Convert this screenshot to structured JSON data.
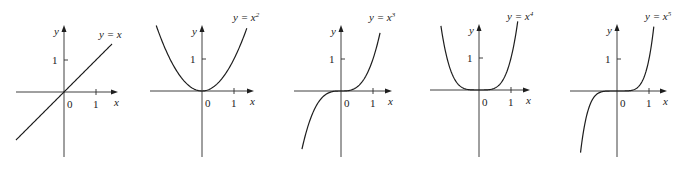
{
  "chart_data": [
    {
      "type": "line",
      "title": "y = x",
      "label_base": "y = x",
      "exponent": "",
      "power": 1,
      "xlabel": "x",
      "ylabel": "y",
      "origin_label": "0",
      "x_tick_labels": [
        "1"
      ],
      "y_tick_labels": [
        "1"
      ],
      "xlim": [
        -1.5,
        1.6
      ],
      "ylim": [
        -2.0,
        2.1
      ],
      "x": [
        -1.5,
        -1,
        -0.5,
        0,
        0.5,
        1,
        1.5
      ],
      "y": [
        -1.5,
        -1,
        -0.5,
        0,
        0.5,
        1,
        1.5
      ],
      "grid": false
    },
    {
      "type": "line",
      "title": "y = x^2",
      "label_base": "y = x",
      "exponent": "2",
      "power": 2,
      "xlabel": "x",
      "ylabel": "y",
      "origin_label": "0",
      "x_tick_labels": [
        "1"
      ],
      "y_tick_labels": [
        "1"
      ],
      "xlim": [
        -1.5,
        1.6
      ],
      "ylim": [
        -2.0,
        2.1
      ],
      "x": [
        -1.4,
        -1,
        -0.5,
        0,
        0.5,
        1,
        1.4
      ],
      "y": [
        1.96,
        1,
        0.25,
        0,
        0.25,
        1,
        1.96
      ],
      "grid": false
    },
    {
      "type": "line",
      "title": "y = x^3",
      "label_base": "y = x",
      "exponent": "3",
      "power": 3,
      "xlabel": "x",
      "ylabel": "y",
      "origin_label": "0",
      "x_tick_labels": [
        "1"
      ],
      "y_tick_labels": [
        "1"
      ],
      "xlim": [
        -1.5,
        1.6
      ],
      "ylim": [
        -2.0,
        2.1
      ],
      "x": [
        -1.22,
        -1,
        -0.5,
        0,
        0.5,
        1,
        1.22
      ],
      "y": [
        -1.82,
        -1,
        -0.125,
        0,
        0.125,
        1,
        1.82
      ],
      "grid": false
    },
    {
      "type": "line",
      "title": "y = x^4",
      "label_base": "y = x",
      "exponent": "4",
      "power": 4,
      "xlabel": "x",
      "ylabel": "y",
      "origin_label": "0",
      "x_tick_labels": [
        "1"
      ],
      "y_tick_labels": [
        "1"
      ],
      "xlim": [
        -1.5,
        1.6
      ],
      "ylim": [
        -2.0,
        2.1
      ],
      "x": [
        -1.2,
        -1,
        -0.5,
        0,
        0.5,
        1,
        1.2
      ],
      "y": [
        2.07,
        1,
        0.0625,
        0,
        0.0625,
        1,
        2.07
      ],
      "grid": false
    },
    {
      "type": "line",
      "title": "y = x^5",
      "label_base": "y = x",
      "exponent": "5",
      "power": 5,
      "xlabel": "x",
      "ylabel": "y",
      "origin_label": "0",
      "x_tick_labels": [
        "1"
      ],
      "y_tick_labels": [
        "1"
      ],
      "xlim": [
        -1.5,
        1.6
      ],
      "ylim": [
        -2.0,
        2.1
      ],
      "x": [
        -1.14,
        -1,
        -0.5,
        0,
        0.5,
        1,
        1.14
      ],
      "y": [
        -1.93,
        -1,
        -0.03,
        0,
        0.03,
        1,
        1.93
      ],
      "grid": false
    }
  ],
  "layout": {
    "panels": [
      {
        "ox": 64,
        "oy": 92,
        "xmin": -1.5,
        "xmax": 1.5,
        "axis_left": 16,
        "axis_right": 118,
        "axis_top": 25,
        "axis_bottom": 157,
        "label_x": 99,
        "label_y": 38
      },
      {
        "ox": 202,
        "oy": 91,
        "xmin": -1.43,
        "xmax": 1.4,
        "axis_left": 150,
        "axis_right": 254,
        "axis_top": 25,
        "axis_bottom": 157,
        "label_x": 233,
        "label_y": 21
      },
      {
        "ox": 341,
        "oy": 91,
        "xmin": -1.22,
        "xmax": 1.22,
        "axis_left": 294,
        "axis_right": 392,
        "axis_top": 25,
        "axis_bottom": 157,
        "label_x": 369,
        "label_y": 21
      },
      {
        "ox": 479,
        "oy": 90,
        "xmin": -1.19,
        "xmax": 1.21,
        "axis_left": 430,
        "axis_right": 530,
        "axis_top": 24,
        "axis_bottom": 157,
        "label_x": 507,
        "label_y": 20
      },
      {
        "ox": 617,
        "oy": 91,
        "xmin": -1.14,
        "xmax": 1.15,
        "axis_left": 570,
        "axis_right": 667,
        "axis_top": 24,
        "axis_bottom": 157,
        "label_x": 645,
        "label_y": 20
      }
    ],
    "unit_px": 32,
    "colors": {
      "ink": "#1e1e1e",
      "axis": "#2a2a2a",
      "background": "#ffffff"
    }
  }
}
